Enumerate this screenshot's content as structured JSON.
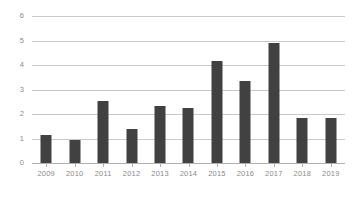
{
  "chart_data": {
    "type": "bar",
    "title": "",
    "subtitle": "",
    "xlabel": "",
    "ylabel": "",
    "categories": [
      "2009",
      "2010",
      "2011",
      "2012",
      "2013",
      "2014",
      "2015",
      "2016",
      "2017",
      "2018",
      "2019"
    ],
    "values": [
      1.15,
      0.95,
      2.55,
      1.38,
      2.32,
      2.25,
      4.15,
      3.35,
      4.9,
      1.82,
      1.82
    ],
    "ylim": [
      0,
      6
    ],
    "ytick_labels": [
      "0",
      "1",
      "2",
      "3",
      "4",
      "5",
      "6"
    ],
    "ytick_values": [
      0,
      1,
      2,
      3,
      4,
      5,
      6
    ],
    "grid": true,
    "grid_axis": "y",
    "legend": false,
    "legend_position": "none",
    "colors": {
      "bar": "#414141",
      "gridline": "#c9c9c9",
      "axis": "#b0b0b0",
      "tick_label": "#8a8a8a",
      "background": "#ffffff"
    }
  }
}
